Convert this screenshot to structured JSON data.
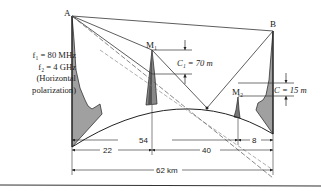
{
  "diagram": {
    "points": {
      "transmitter": "A",
      "receiver": "B",
      "obstacle_1": "M₁",
      "obstacle_2": "M₂"
    },
    "parameters": {
      "f1": "f₁ = 80 MHz",
      "f2": "f₂ = 4 GHz",
      "polarization_line1": "(Horizontal",
      "polarization_line2": "polarization)"
    },
    "clearances": {
      "c1": "C₁ = 70 m",
      "c2": "C = 15 m"
    },
    "distances": {
      "a_to_m1": "22",
      "a_to_m2": "54",
      "m1_to_b": "40",
      "m2_to_b": "8",
      "total": "62 km"
    },
    "colors": {
      "line": "#333333",
      "terrain_fill": "#9a9a9a",
      "obstacle_dark": "#555555"
    }
  }
}
